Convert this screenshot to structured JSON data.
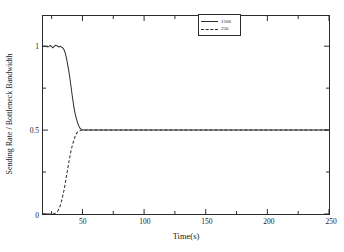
{
  "chart_data": {
    "type": "line",
    "title": "",
    "subtitle": "",
    "xlabel": "Time(s)",
    "ylabel": "Sending Rate / Bottleneck Bandwidth",
    "xlim": [
      18,
      250
    ],
    "ylim": [
      0,
      1.18
    ],
    "grid": false,
    "legend_position": "top-right-inside",
    "x_ticks": [
      50,
      100,
      150,
      200,
      250
    ],
    "x_tick_labels": [
      "50",
      "100",
      "150",
      "200",
      "250"
    ],
    "x_minor_ticks": [
      25,
      75,
      125,
      175,
      225
    ],
    "y_ticks": [
      0,
      0.5,
      1
    ],
    "y_tick_labels": [
      "0",
      "0.5",
      "1"
    ],
    "y_minor_ticks": [
      0.25,
      0.75
    ],
    "series": [
      {
        "name": "1500",
        "style": "solid",
        "color": "#2b2b2b",
        "x": [
          18,
          20,
          22,
          24,
          26,
          28,
          30,
          31,
          32,
          33,
          34,
          35,
          36,
          37,
          38,
          39,
          40,
          41,
          42,
          43,
          44,
          45,
          46,
          47,
          48,
          49,
          50,
          52,
          55,
          60,
          70,
          80,
          100,
          120,
          150,
          180,
          210,
          240,
          250
        ],
        "values": [
          1.0,
          1.0,
          0.995,
          1.005,
          0.99,
          1.005,
          1.0,
          0.995,
          1.0,
          0.995,
          0.99,
          0.98,
          0.96,
          0.93,
          0.89,
          0.85,
          0.8,
          0.745,
          0.69,
          0.64,
          0.6,
          0.57,
          0.545,
          0.525,
          0.512,
          0.504,
          0.5,
          0.5,
          0.5,
          0.5,
          0.5,
          0.5,
          0.5,
          0.5,
          0.5,
          0.5,
          0.5,
          0.5,
          0.5
        ]
      },
      {
        "name": "256",
        "style": "dashed",
        "color": "#2b2b2b",
        "x": [
          18,
          20,
          22,
          24,
          26,
          28,
          29,
          30,
          31,
          32,
          33,
          34,
          35,
          36,
          37,
          38,
          39,
          40,
          41,
          42,
          43,
          44,
          45,
          46,
          47,
          48,
          49,
          50,
          52,
          55,
          60,
          70,
          80,
          100,
          120,
          150,
          180,
          210,
          240,
          250
        ],
        "values": [
          0.0,
          0.0,
          0.0,
          0.0,
          0.0,
          0.005,
          0.01,
          0.018,
          0.03,
          0.05,
          0.075,
          0.105,
          0.14,
          0.18,
          0.225,
          0.268,
          0.31,
          0.35,
          0.385,
          0.415,
          0.44,
          0.462,
          0.478,
          0.488,
          0.494,
          0.497,
          0.499,
          0.5,
          0.5,
          0.5,
          0.5,
          0.5,
          0.5,
          0.5,
          0.5,
          0.5,
          0.5,
          0.5,
          0.5,
          0.5
        ]
      }
    ],
    "legend": [
      {
        "label": "1500",
        "style": "solid"
      },
      {
        "label": "256",
        "style": "dashed"
      }
    ]
  }
}
